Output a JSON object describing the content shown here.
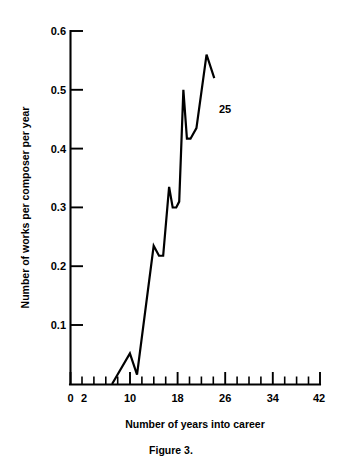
{
  "figure": {
    "caption": "Figure 3.",
    "annotation": {
      "text": "25",
      "x_value": 25,
      "y_value": 0.46
    }
  },
  "chart_data": {
    "type": "line",
    "title": "",
    "subtitle": "",
    "xlabel": "Number of years into career",
    "ylabel": "Number of works per composer per year",
    "xlim": [
      0,
      42
    ],
    "ylim": [
      0,
      0.6
    ],
    "grid": false,
    "legend": null,
    "x_ticks_major": [
      0,
      10,
      18,
      26,
      34,
      42
    ],
    "x_tick_labels": [
      "0",
      "2",
      "10",
      "18",
      "26",
      "34",
      "42"
    ],
    "x_tick_label_values": [
      0,
      2,
      10,
      18,
      26,
      34,
      42
    ],
    "x_ticks_minor": [
      2,
      4,
      6,
      8,
      12,
      14,
      16,
      20,
      22,
      24,
      28,
      30,
      32,
      36,
      38,
      40
    ],
    "y_ticks": [
      0.1,
      0.2,
      0.3,
      0.4,
      0.5,
      0.6
    ],
    "y_tick_labels": [
      "0.1",
      "0.2",
      "0.3",
      "0.4",
      "0.5",
      "0.6"
    ],
    "line_color": "#000000",
    "series": [
      {
        "name": "works per composer per year",
        "x": [
          7.0,
          10.0,
          11.2,
          14.0,
          14.9,
          15.6,
          16.6,
          17.2,
          17.8,
          18.3,
          19.0,
          19.6,
          20.2,
          21.2,
          22.9,
          24.2
        ],
        "values": [
          0.0,
          0.052,
          0.016,
          0.235,
          0.218,
          0.218,
          0.335,
          0.3,
          0.3,
          0.31,
          0.5,
          0.417,
          0.417,
          0.435,
          0.56,
          0.52
        ]
      }
    ]
  }
}
